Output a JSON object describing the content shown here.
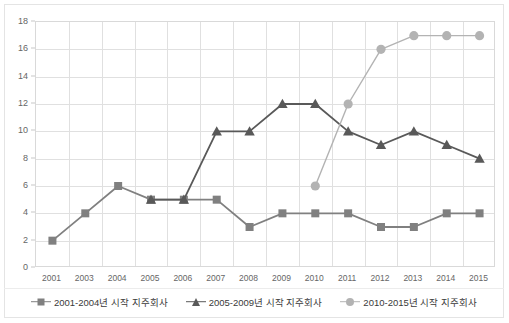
{
  "chart_data": {
    "type": "line",
    "title": "",
    "xlabel": "",
    "ylabel": "",
    "grid": true,
    "legend_position": "bottom",
    "categories": [
      "2001",
      "2003",
      "2004",
      "2005",
      "2006",
      "2007",
      "2008",
      "2009",
      "2010",
      "2011",
      "2012",
      "2013",
      "2014",
      "2015"
    ],
    "ylim": [
      0,
      18
    ],
    "yticks": [
      0,
      2,
      4,
      6,
      8,
      10,
      12,
      14,
      16,
      18
    ],
    "series": [
      {
        "name": "2001-2004년 시작 지주회사",
        "marker": "square",
        "color": "#808080",
        "values": [
          2,
          4,
          6,
          5,
          5,
          5,
          3,
          4,
          4,
          4,
          3,
          3,
          4,
          4
        ]
      },
      {
        "name": "2005-2009년 시작 지주회사",
        "marker": "triangle",
        "color": "#595959",
        "values": [
          null,
          null,
          null,
          5,
          5,
          10,
          10,
          12,
          12,
          10,
          9,
          10,
          9,
          8
        ]
      },
      {
        "name": "2010-2015년 시작 지주회사",
        "marker": "circle",
        "color": "#b3b3b3",
        "values": [
          null,
          null,
          null,
          null,
          null,
          null,
          null,
          null,
          6,
          12,
          16,
          17,
          17,
          17
        ]
      }
    ]
  },
  "legend": {
    "items": [
      {
        "label": "2001-2004년 시작 지주회사"
      },
      {
        "label": "2005-2009년 시작 지주회사"
      },
      {
        "label": "2010-2015년 시작 지주회사"
      }
    ]
  }
}
